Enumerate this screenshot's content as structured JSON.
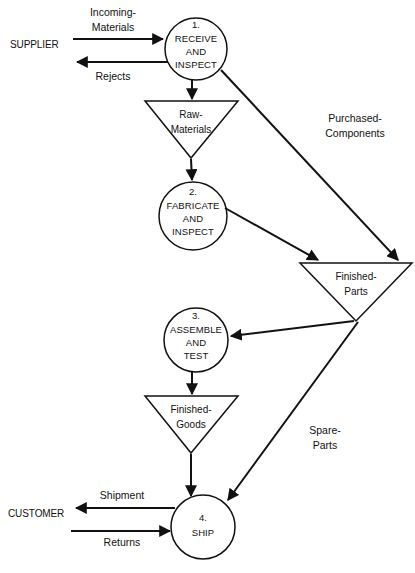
{
  "diagram": {
    "type": "data-flow-diagram",
    "external_entities": [
      {
        "id": "supplier",
        "label": "SUPPLIER",
        "x": 10,
        "y": 48
      },
      {
        "id": "customer",
        "label": "CUSTOMER",
        "x": 8,
        "y": 517
      }
    ],
    "processes": [
      {
        "id": "p1",
        "number": "1.",
        "lines": [
          "RECEIVE",
          "AND",
          "INSPECT"
        ],
        "cx": 196,
        "cy": 49,
        "r": 31
      },
      {
        "id": "p2",
        "number": "2.",
        "lines": [
          "FABRICATE",
          "AND",
          "INSPECT"
        ],
        "cx": 193,
        "cy": 216,
        "r": 34
      },
      {
        "id": "p3",
        "number": "3.",
        "lines": [
          "ASSEMBLE",
          "AND",
          "TEST"
        ],
        "cx": 196,
        "cy": 340,
        "r": 32
      },
      {
        "id": "p4",
        "number": "4.",
        "lines": [
          "SHIP"
        ],
        "cx": 203,
        "cy": 527,
        "r": 32
      }
    ],
    "data_stores": [
      {
        "id": "raw-materials",
        "lines": [
          "Raw-",
          "Materials"
        ],
        "left": 145,
        "right": 238,
        "top": 101,
        "apex_y": 158
      },
      {
        "id": "finished-parts",
        "lines": [
          "Finished-",
          "Parts"
        ],
        "left": 300,
        "right": 412,
        "top": 263,
        "apex_y": 321
      },
      {
        "id": "finished-goods",
        "lines": [
          "Finished-",
          "Goods"
        ],
        "left": 145,
        "right": 238,
        "top": 396,
        "apex_y": 453
      }
    ],
    "flows": [
      {
        "id": "incoming-materials",
        "lines": [
          "Incoming-",
          "Materials"
        ],
        "label_x": 113,
        "label_y": 16
      },
      {
        "id": "rejects",
        "lines": [
          "Rejects"
        ],
        "label_x": 113,
        "label_y": 80
      },
      {
        "id": "purchased-components",
        "lines": [
          "Purchased-",
          "Components"
        ],
        "label_x": 355,
        "label_y": 122
      },
      {
        "id": "spare-parts",
        "lines": [
          "Spare-",
          "Parts"
        ],
        "label_x": 325,
        "label_y": 434
      },
      {
        "id": "shipment",
        "lines": [
          "Shipment"
        ],
        "label_x": 122,
        "label_y": 499
      },
      {
        "id": "returns",
        "lines": [
          "Returns"
        ],
        "label_x": 122,
        "label_y": 546
      }
    ]
  },
  "colors": {
    "stroke": "#111111",
    "background": "#ffffff"
  }
}
